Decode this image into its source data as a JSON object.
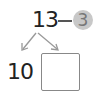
{
  "diagram": {
    "top_number": "13",
    "subtract_number": "3",
    "left_result": "10",
    "answer_box_value": "",
    "operator_icon": "minus-sign",
    "colors": {
      "text": "#222222",
      "circle": "#c8c8c8",
      "arrow": "#888888",
      "box_border": "#888888"
    }
  }
}
